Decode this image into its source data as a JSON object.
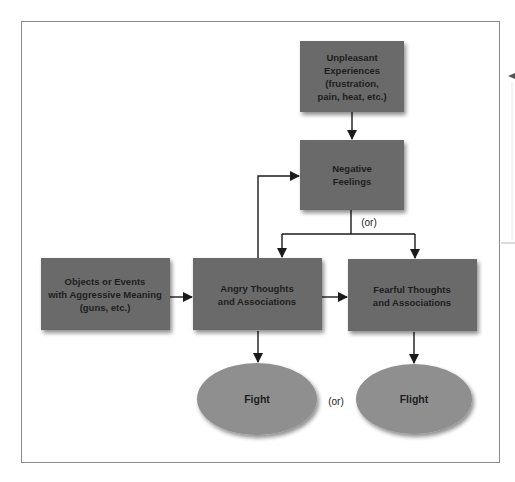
{
  "colors": {
    "box_fill": "#6b6b6b",
    "ellipse_fill": "#8f8f8f",
    "text": "#1e1e1e",
    "line": "#1a1a1a",
    "frame": "#8a8a8a"
  },
  "nodes": {
    "unpleasant": {
      "lines": [
        "Unpleasant",
        "Experiences",
        "(frustration,",
        "pain, heat, etc.)"
      ]
    },
    "negative": {
      "lines": [
        "Negative",
        "Feelings"
      ]
    },
    "objects": {
      "lines": [
        "Objects or Events",
        "with Aggressive Meaning",
        "(guns, etc.)"
      ]
    },
    "angry": {
      "lines": [
        "Angry Thoughts",
        "and Associations"
      ]
    },
    "fearful": {
      "lines": [
        "Fearful Thoughts",
        "and Associations"
      ]
    },
    "fight": {
      "label": "Fight"
    },
    "flight": {
      "label": "Flight"
    }
  },
  "connector_labels": {
    "negative_split": "(or)",
    "fight_flight": "(or)"
  }
}
